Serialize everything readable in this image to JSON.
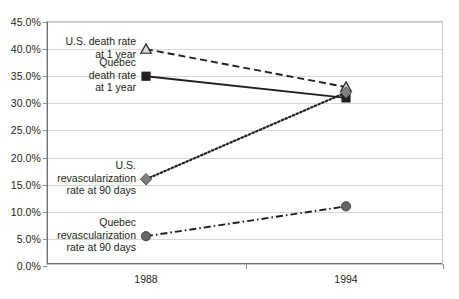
{
  "chart_data": {
    "type": "line",
    "title": "",
    "xlabel": "",
    "ylabel": "",
    "categories": [
      "1988",
      "1994"
    ],
    "x_tick_labels": [
      "1988",
      "1994"
    ],
    "y_tick_labels": [
      "0.0%",
      "5.0%",
      "10.0%",
      "15.0%",
      "20.0%",
      "25.0%",
      "30.0%",
      "35.0%",
      "40.0%",
      "45.0%"
    ],
    "y_tick_values": [
      0,
      5,
      10,
      15,
      20,
      25,
      30,
      35,
      40,
      45
    ],
    "ylim": [
      0,
      45
    ],
    "grid": true,
    "legend_position": "inline-annotations",
    "series": [
      {
        "name": "U.S. death rate at 1 year",
        "label": "U.S. death rate\nat 1 year",
        "values": [
          40.0,
          33.0
        ],
        "line_style": "dashed",
        "marker": "triangle-open",
        "color": "#231f20",
        "marker_fill": "#d9d9d9"
      },
      {
        "name": "Quebec death rate at 1 year",
        "label": "Quebec\ndeath rate\nat 1 year",
        "values": [
          35.0,
          31.0
        ],
        "line_style": "solid",
        "marker": "square-filled",
        "color": "#231f20",
        "marker_fill": "#231f20"
      },
      {
        "name": "U.S. revascularization rate at 90 days",
        "label": "U.S.\nrevascularization\nrate at 90 days",
        "values": [
          16.0,
          32.0
        ],
        "line_style": "dotted",
        "marker": "diamond-filled",
        "color": "#231f20",
        "marker_fill": "#808080"
      },
      {
        "name": "Quebec revascularization rate at 90 days",
        "label": "Quebec\nrevascularization\nrate at 90 days",
        "values": [
          5.5,
          11.0
        ],
        "line_style": "dash-dot",
        "marker": "circle-filled",
        "color": "#231f20",
        "marker_fill": "#666666"
      }
    ],
    "colors": {
      "gridline": "#d8d8d8",
      "axis": "#6f6f6f",
      "plot_border": "#c9c9c9",
      "text": "#231f20",
      "background": "#ffffff"
    }
  }
}
